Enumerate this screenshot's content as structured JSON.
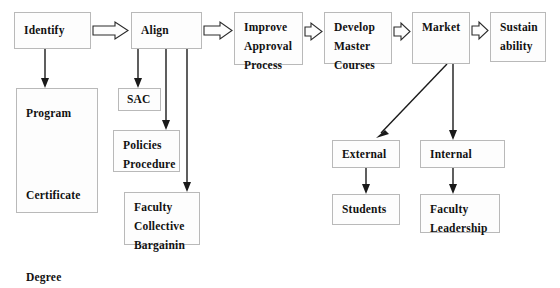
{
  "diagram": {
    "background_color": "#ffffff",
    "box_fill": "#fdfdfd",
    "box_border": "#b9b9b9",
    "line_color": "#1a1a1a",
    "nodes": [
      {
        "id": "identify",
        "label": "Identify",
        "x": 14,
        "y": 12,
        "w": 77,
        "h": 37
      },
      {
        "id": "align",
        "label": "Align",
        "x": 131,
        "y": 12,
        "w": 71,
        "h": 37
      },
      {
        "id": "improve",
        "label": "Improve\nApproval\nProcess",
        "x": 234,
        "y": 12,
        "w": 69,
        "h": 53
      },
      {
        "id": "develop",
        "label": "Develop\nMaster\nCourses",
        "x": 324,
        "y": 12,
        "w": 68,
        "h": 52
      },
      {
        "id": "market",
        "label": "Market",
        "x": 412,
        "y": 12,
        "w": 58,
        "h": 52
      },
      {
        "id": "sustain",
        "label": "Sustain\nability",
        "x": 490,
        "y": 12,
        "w": 56,
        "h": 50
      },
      {
        "id": "program",
        "label": "Program\n\nCertificate\n\nDegree",
        "x": 16,
        "y": 88,
        "w": 82,
        "h": 125
      },
      {
        "id": "sac",
        "label": "SAC",
        "x": 118,
        "y": 88,
        "w": 43,
        "h": 23
      },
      {
        "id": "policies",
        "label": "Policies\nProcedure",
        "x": 113,
        "y": 130,
        "w": 67,
        "h": 42
      },
      {
        "id": "faculty_cb",
        "label": "Faculty\nCollective\nBargainin",
        "x": 124,
        "y": 192,
        "w": 76,
        "h": 53
      },
      {
        "id": "external",
        "label": "External",
        "x": 332,
        "y": 140,
        "w": 68,
        "h": 28
      },
      {
        "id": "internal",
        "label": "Internal",
        "x": 420,
        "y": 140,
        "w": 85,
        "h": 28
      },
      {
        "id": "students",
        "label": "Students",
        "x": 332,
        "y": 194,
        "w": 68,
        "h": 31
      },
      {
        "id": "faculty_leadership",
        "label": "Faculty\nLeadership",
        "x": 420,
        "y": 194,
        "w": 80,
        "h": 39
      }
    ],
    "block_arrows": [
      {
        "id": "identify-to-align",
        "from": "identify",
        "to": "align"
      },
      {
        "id": "align-to-improve",
        "from": "align",
        "to": "improve"
      },
      {
        "id": "improve-to-develop",
        "from": "improve",
        "to": "develop"
      },
      {
        "id": "develop-to-market",
        "from": "develop",
        "to": "market"
      },
      {
        "id": "market-to-sustain",
        "from": "market",
        "to": "sustain"
      }
    ],
    "line_arrows": [
      {
        "id": "identify-to-program",
        "from": "identify",
        "to": "program"
      },
      {
        "id": "align-to-sac",
        "from": "align",
        "to": "sac"
      },
      {
        "id": "align-to-policies",
        "from": "align",
        "to": "policies"
      },
      {
        "id": "align-to-faculty-cb",
        "from": "align",
        "to": "faculty_cb"
      },
      {
        "id": "market-to-external",
        "from": "market",
        "to": "external"
      },
      {
        "id": "market-to-internal",
        "from": "market",
        "to": "internal"
      },
      {
        "id": "external-to-students",
        "from": "external",
        "to": "students"
      },
      {
        "id": "internal-to-faculty-leadership",
        "from": "internal",
        "to": "faculty_leadership"
      }
    ]
  }
}
